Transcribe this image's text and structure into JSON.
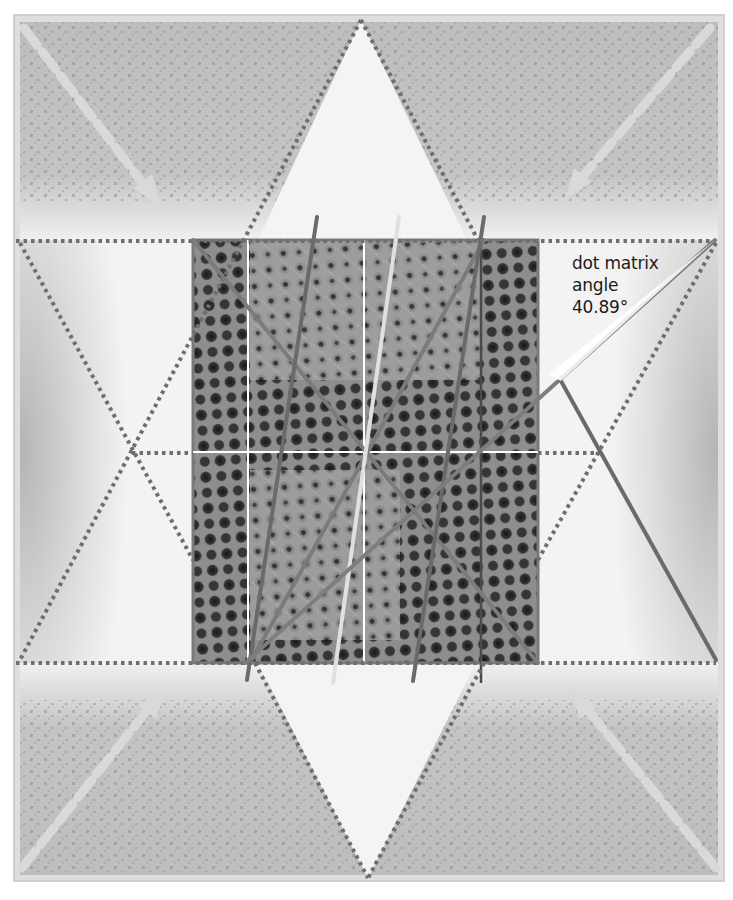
{
  "figure": {
    "annotation": {
      "line1": "dot matrix",
      "line2": "angle",
      "value": "40.89°"
    },
    "angle_degrees": 40.89,
    "colors": {
      "background": "#ffffff",
      "frame_fill": "#d9d9d9",
      "panel_gray": "#b9b9b9",
      "panel_light": "#f3f3f3",
      "dotted_guide": "#6f6f6f",
      "ray_dark": "#555555",
      "ray_mid": "#7d7d7d",
      "ray_light": "#d8d8d8",
      "arrow": "#dcdcdc",
      "sample_base": "#8c8c8c",
      "sample_dot": "#2e2e2e"
    },
    "guides": [
      "top-horizontal-dotted",
      "middle-horizontal-dotted",
      "bottom-horizontal-dotted",
      "hexagram-up-triangle",
      "hexagram-down-triangle"
    ],
    "arrows": [
      "top-left",
      "top-right",
      "bottom-left",
      "bottom-right"
    ]
  }
}
